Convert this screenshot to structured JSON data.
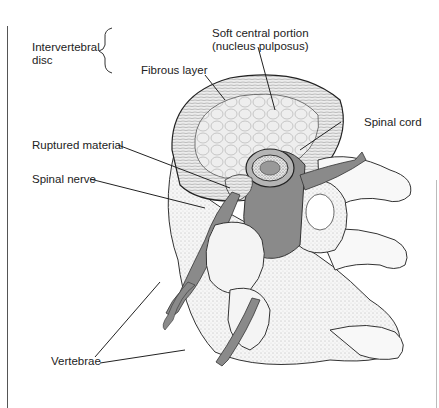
{
  "figure": {
    "colors": {
      "nerve_gray": "#8a8a8a",
      "bone_white": "#f4f4f4",
      "line": "#222222"
    }
  },
  "labels": {
    "intervertebral_disc_line1": "Intervertebral",
    "intervertebral_disc_line2": "disc",
    "soft_central_line1": "Soft central portion",
    "soft_central_line2": "(nucleus pulposus)",
    "fibrous_layer": "Fibrous layer",
    "spinal_cord": "Spinal cord",
    "ruptured_material": "Ruptured material",
    "spinal_nerve": "Spinal nerve",
    "vertebrae": "Vertebrae"
  }
}
